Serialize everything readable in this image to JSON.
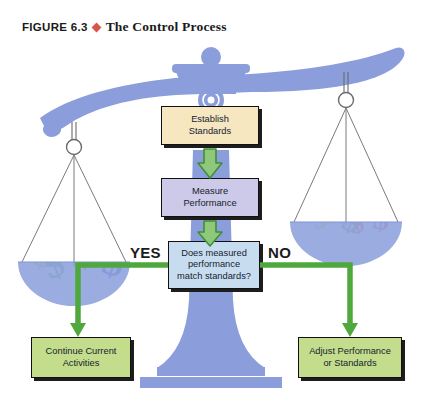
{
  "figure": {
    "label": "FIGURE 6.3",
    "separator_icon": "diamond-icon",
    "title": "The Control Process"
  },
  "flow": {
    "establish": "Establish\nStandards",
    "establish_line1": "Establish",
    "establish_line2": "Standards",
    "measure_line1": "Measure",
    "measure_line2": "Performance",
    "decision_line1": "Does measured",
    "decision_line2": "performance",
    "decision_line3": "match standards?",
    "continue_line1": "Continue Current",
    "continue_line2": "Activities",
    "adjust_line1": "Adjust Performance",
    "adjust_line2": "or Standards"
  },
  "branches": {
    "yes": "YES",
    "no": "NO"
  },
  "colors": {
    "establish_box": "#f6e7c1",
    "measure_box": "#cdc9e8",
    "decision_box": "#c8dcf0",
    "outcome_box": "#c3dd8d",
    "arrow_fill": "#8fc87a",
    "arrow_stroke": "#3f8f37",
    "connector_green": "#4fa83d",
    "scale_blue": "#8b9edb",
    "scale_pan": "#8fa3dd",
    "diamond_red": "#d9534f",
    "money_blue": "#2a4fa8",
    "money_red": "#e8503a",
    "money_green": "#5cb548",
    "money_yellow": "#f0c93c"
  },
  "artwork": {
    "scale_icon": "balance-scale-icon",
    "left_pan_contents": "dollar-sign-cluster",
    "right_pan_contents": "dollar-sign-cluster"
  }
}
